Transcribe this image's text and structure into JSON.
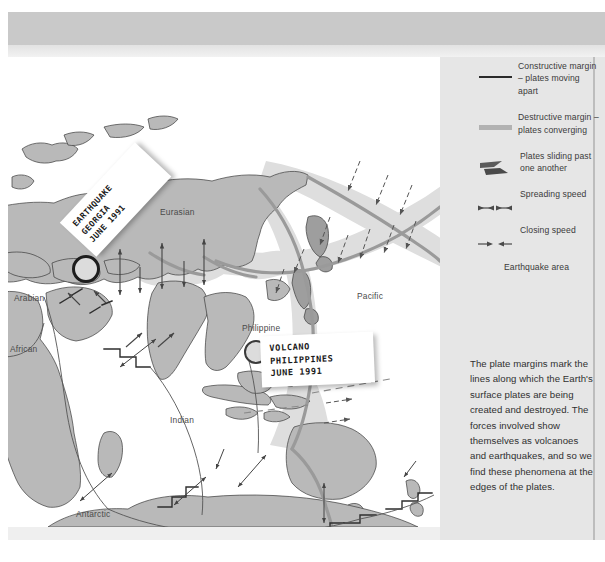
{
  "figure": {
    "title_band": "",
    "map": {
      "plate_labels": [
        {
          "name": "Eurasian",
          "x": 160,
          "y": 156
        },
        {
          "name": "Pacific",
          "x": 357,
          "y": 240
        },
        {
          "name": "Arabian",
          "x": 14,
          "y": 242
        },
        {
          "name": "African",
          "x": 8,
          "y": 293
        },
        {
          "name": "Indian",
          "x": 170,
          "y": 364
        },
        {
          "name": "Philippine",
          "x": 242,
          "y": 272
        },
        {
          "name": "Antarctic",
          "x": 75,
          "y": 458
        }
      ],
      "scale_note": "4 in (10 cm) yr-1 relative velocity",
      "callouts": [
        {
          "id": "georgia",
          "lines": [
            "EARTHQUAKE",
            "GEORGIA",
            "JUNE 1991"
          ]
        },
        {
          "id": "philippines",
          "lines": [
            "VOLCANO",
            "PHILIPPINES",
            "JUNE 1991"
          ]
        }
      ]
    },
    "legend": {
      "items": [
        {
          "symbol": "constructive-margin-line",
          "text": "Constructive margin – plates moving apart"
        },
        {
          "symbol": "destructive-margin-band",
          "text": "Destructive margin – plates converging"
        },
        {
          "symbol": "transform-arrows",
          "text": "Plates sliding past one another"
        },
        {
          "symbol": "spreading-speed-arrows",
          "text": "Spreading speed"
        },
        {
          "symbol": "closing-speed-arrows",
          "text": "Closing speed"
        },
        {
          "symbol": "none",
          "text": "Earthquake area"
        }
      ]
    },
    "caption": "The plate margins mark the lines along which the Earth's surface plates are being created and destroyed. The forces involved show themselves as volcanoes and earthquakes, and so we find these phenomena at the edges of the plates."
  },
  "colors": {
    "land": "#b9b9b9",
    "ocean": "#ffffff",
    "quake_zone": "#dedede",
    "margin_line": "#9a9a9a",
    "constructive": "#2b2b2b",
    "panel_bg": "#e6e6e6",
    "band": "#c9c9c9",
    "text": "#3a3a3a"
  }
}
